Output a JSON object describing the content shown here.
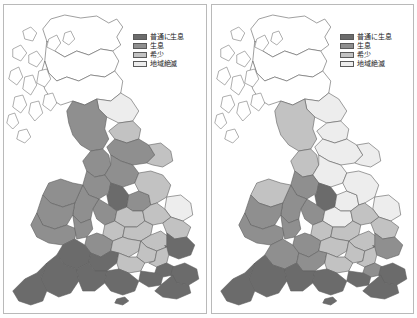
{
  "figure": {
    "panel_count": 2,
    "background": "#ffffff",
    "frame_color": "#b9b9b9"
  },
  "legend": {
    "entries": [
      {
        "label": "普通に生息",
        "color": "#6b6b6b",
        "rank": 1
      },
      {
        "label": "生息",
        "color": "#8f8f8f",
        "rank": 2
      },
      {
        "label": "希少",
        "color": "#c2c2c2",
        "rank": 3
      },
      {
        "label": "地域絶滅",
        "color": "#ededed",
        "rank": 4
      }
    ]
  },
  "panels": [
    {
      "id": "panel-left",
      "name": "left-map"
    },
    {
      "id": "panel-right",
      "name": "right-map"
    }
  ],
  "chart_data": {
    "type": "heatmap",
    "title": "",
    "subtitle": "",
    "xlabel": "",
    "ylabel": "",
    "grid": false,
    "legend_position": "upper-right-inside",
    "map_region": "Great Britain (England, Wales, Scotland)",
    "classes": [
      "普通に生息",
      "生息",
      "希少",
      "地域絶滅"
    ],
    "class_colors": [
      "#6b6b6b",
      "#8f8f8f",
      "#c2c2c2",
      "#ededed"
    ],
    "unfilled_color": "#ffffff",
    "outline_color": "#5f5f5f",
    "series": [
      {
        "name": "left-map",
        "values": [
          {
            "region": "scotland-north",
            "class": null
          },
          {
            "region": "scotland-central",
            "class": null
          },
          {
            "region": "scotland-south",
            "class": null
          },
          {
            "region": "northumberland",
            "class": "地域絶滅"
          },
          {
            "region": "cumbria",
            "class": "生息"
          },
          {
            "region": "durham",
            "class": "希少"
          },
          {
            "region": "yorkshire-north",
            "class": "生息"
          },
          {
            "region": "yorkshire-east",
            "class": "希少"
          },
          {
            "region": "lancashire",
            "class": "生息"
          },
          {
            "region": "yorkshire-west",
            "class": "生息"
          },
          {
            "region": "cheshire",
            "class": "生息"
          },
          {
            "region": "derbyshire",
            "class": "普通に生息"
          },
          {
            "region": "nottinghamshire",
            "class": "生息"
          },
          {
            "region": "lincolnshire",
            "class": "希少"
          },
          {
            "region": "norfolk",
            "class": "地域絶滅"
          },
          {
            "region": "suffolk",
            "class": "希少"
          },
          {
            "region": "staffordshire",
            "class": "生息"
          },
          {
            "region": "shropshire",
            "class": "生息"
          },
          {
            "region": "leicestershire",
            "class": "希少"
          },
          {
            "region": "cambridgeshire",
            "class": "希少"
          },
          {
            "region": "wales-north",
            "class": "生息"
          },
          {
            "region": "wales-mid",
            "class": "生息"
          },
          {
            "region": "wales-south",
            "class": "生息"
          },
          {
            "region": "herefordshire",
            "class": "生息"
          },
          {
            "region": "warwickshire",
            "class": "希少"
          },
          {
            "region": "northamptonshire",
            "class": "希少"
          },
          {
            "region": "bedfordshire",
            "class": "希少"
          },
          {
            "region": "essex",
            "class": "普通に生息"
          },
          {
            "region": "gloucestershire",
            "class": "生息"
          },
          {
            "region": "oxfordshire",
            "class": "希少"
          },
          {
            "region": "buckinghamshire",
            "class": "希少"
          },
          {
            "region": "hertfordshire",
            "class": "希少"
          },
          {
            "region": "london",
            "class": "普通に生息"
          },
          {
            "region": "kent",
            "class": "普通に生息"
          },
          {
            "region": "somerset",
            "class": "普通に生息"
          },
          {
            "region": "wiltshire",
            "class": "普通に生息"
          },
          {
            "region": "berkshire",
            "class": "希少"
          },
          {
            "region": "surrey",
            "class": "普通に生息"
          },
          {
            "region": "sussex",
            "class": "普通に生息"
          },
          {
            "region": "devon",
            "class": "普通に生息"
          },
          {
            "region": "dorset",
            "class": "普通に生息"
          },
          {
            "region": "hampshire",
            "class": "普通に生息"
          },
          {
            "region": "cornwall",
            "class": "普通に生息"
          },
          {
            "region": "isle-of-wight",
            "class": "普通に生息"
          }
        ]
      },
      {
        "name": "right-map",
        "values": [
          {
            "region": "scotland-north",
            "class": null
          },
          {
            "region": "scotland-central",
            "class": null
          },
          {
            "region": "scotland-south",
            "class": null
          },
          {
            "region": "northumberland",
            "class": "地域絶滅"
          },
          {
            "region": "cumbria",
            "class": "希少"
          },
          {
            "region": "durham",
            "class": "地域絶滅"
          },
          {
            "region": "yorkshire-north",
            "class": "地域絶滅"
          },
          {
            "region": "yorkshire-east",
            "class": "地域絶滅"
          },
          {
            "region": "lancashire",
            "class": "希少"
          },
          {
            "region": "yorkshire-west",
            "class": "地域絶滅"
          },
          {
            "region": "cheshire",
            "class": "生息"
          },
          {
            "region": "derbyshire",
            "class": "普通に生息"
          },
          {
            "region": "nottinghamshire",
            "class": "地域絶滅"
          },
          {
            "region": "lincolnshire",
            "class": "地域絶滅"
          },
          {
            "region": "norfolk",
            "class": "地域絶滅"
          },
          {
            "region": "suffolk",
            "class": "希少"
          },
          {
            "region": "staffordshire",
            "class": "生息"
          },
          {
            "region": "shropshire",
            "class": "生息"
          },
          {
            "region": "leicestershire",
            "class": "地域絶滅"
          },
          {
            "region": "cambridgeshire",
            "class": "希少"
          },
          {
            "region": "wales-north",
            "class": "希少"
          },
          {
            "region": "wales-mid",
            "class": "生息"
          },
          {
            "region": "wales-south",
            "class": "生息"
          },
          {
            "region": "herefordshire",
            "class": "生息"
          },
          {
            "region": "warwickshire",
            "class": "希少"
          },
          {
            "region": "northamptonshire",
            "class": "希少"
          },
          {
            "region": "bedfordshire",
            "class": "希少"
          },
          {
            "region": "essex",
            "class": "生息"
          },
          {
            "region": "gloucestershire",
            "class": "生息"
          },
          {
            "region": "oxfordshire",
            "class": "希少"
          },
          {
            "region": "buckinghamshire",
            "class": "希少"
          },
          {
            "region": "hertfordshire",
            "class": "希少"
          },
          {
            "region": "london",
            "class": "生息"
          },
          {
            "region": "kent",
            "class": "普通に生息"
          },
          {
            "region": "somerset",
            "class": "生息"
          },
          {
            "region": "wiltshire",
            "class": "生息"
          },
          {
            "region": "berkshire",
            "class": "希少"
          },
          {
            "region": "surrey",
            "class": "普通に生息"
          },
          {
            "region": "sussex",
            "class": "普通に生息"
          },
          {
            "region": "devon",
            "class": "普通に生息"
          },
          {
            "region": "dorset",
            "class": "普通に生息"
          },
          {
            "region": "hampshire",
            "class": "普通に生息"
          },
          {
            "region": "cornwall",
            "class": "普通に生息"
          },
          {
            "region": "isle-of-wight",
            "class": "普通に生息"
          }
        ]
      }
    ]
  }
}
